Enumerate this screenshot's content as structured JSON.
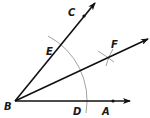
{
  "diagram": {
    "colors": {
      "ray": "#111111",
      "arc": "#8a8a8a",
      "label": "#1a1a1a"
    },
    "points": {
      "B": {
        "label": "B"
      },
      "A": {
        "label": "A"
      },
      "C": {
        "label": "C"
      },
      "D": {
        "label": "D"
      },
      "E": {
        "label": "E"
      },
      "F": {
        "label": "F"
      }
    },
    "rays": [
      {
        "from": "B",
        "through": "A",
        "name": "ray-BA"
      },
      {
        "from": "B",
        "through": "C",
        "name": "ray-BC"
      },
      {
        "from": "B",
        "through": "F",
        "name": "ray-BF"
      }
    ],
    "arcs": [
      {
        "center": "B",
        "through": [
          "E",
          "D"
        ],
        "name": "arc-ED"
      },
      {
        "center": "E",
        "near": "F",
        "name": "arc-from-E"
      },
      {
        "center": "D",
        "near": "F",
        "name": "arc-from-D"
      }
    ]
  }
}
